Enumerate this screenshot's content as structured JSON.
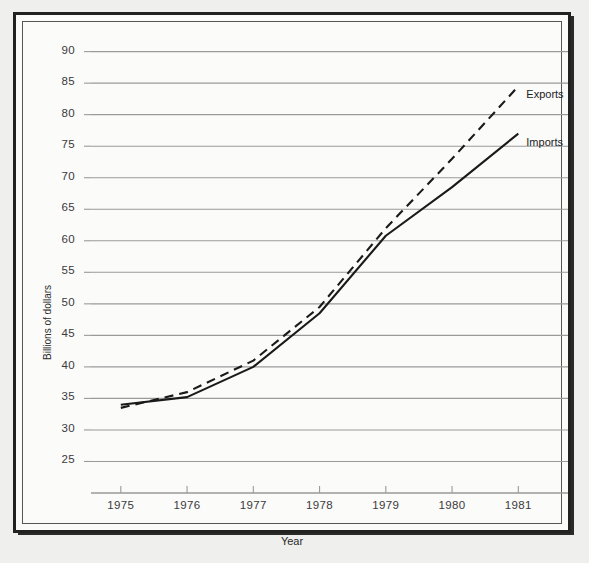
{
  "figure": {
    "background_color": "#fbfbfa",
    "frame_color": "#222222",
    "gridline_color": "#9a9a9a"
  },
  "chart_data": {
    "type": "line",
    "title": "",
    "xlabel": "Year",
    "ylabel": "Billions of dollars",
    "x": [
      1975,
      1976,
      1977,
      1978,
      1979,
      1980,
      1981
    ],
    "xtick_labels": [
      "1975",
      "1976",
      "1977",
      "1978",
      "1979",
      "1980",
      "1981"
    ],
    "ytick_labels": [
      "25",
      "30",
      "35",
      "40",
      "45",
      "50",
      "55",
      "60",
      "65",
      "70",
      "75",
      "80",
      "85",
      "90"
    ],
    "yticks": [
      25,
      30,
      35,
      40,
      45,
      50,
      55,
      60,
      65,
      70,
      75,
      80,
      85,
      90
    ],
    "ylim": [
      20,
      92
    ],
    "xlim": [
      1974.55,
      1981.75
    ],
    "grid": true,
    "grid_axis": "y",
    "legend_position": "inline-right-of-line-end",
    "series": [
      {
        "name": "Exports",
        "style": "dashed",
        "color": "#1a1a1a",
        "values": [
          33.5,
          36.0,
          41.0,
          49.5,
          62.0,
          73.0,
          84.5
        ]
      },
      {
        "name": "Imports",
        "style": "solid",
        "color": "#1a1a1a",
        "values": [
          34.0,
          35.2,
          40.0,
          48.5,
          60.8,
          68.5,
          77.0
        ]
      }
    ],
    "annotations": [
      {
        "text": "Exports",
        "at_x": 1981,
        "at_y": 84.5
      },
      {
        "text": "Imports",
        "at_x": 1981,
        "at_y": 77.0
      }
    ]
  }
}
